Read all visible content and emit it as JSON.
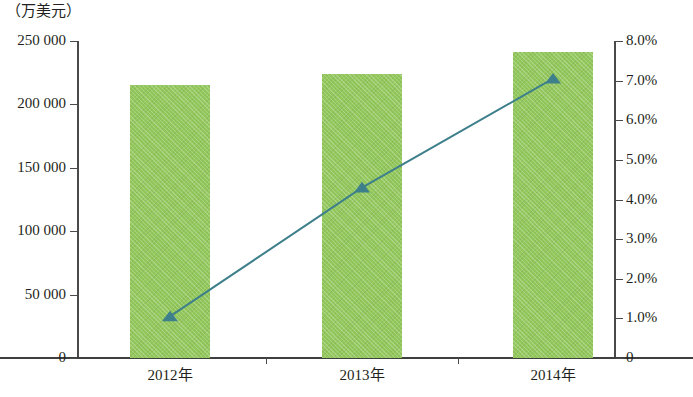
{
  "chart_data": {
    "type": "bar",
    "title": "",
    "subtitle": "",
    "unit_label": "（万美元）",
    "xlabel": "",
    "ylabel": "",
    "categories": [
      "2012年",
      "2013年",
      "2014年"
    ],
    "grid": false,
    "legend_position": "none",
    "series": [
      {
        "name": "金额",
        "type": "bar",
        "axis": "left",
        "color": "#92c85c",
        "values": [
          215000,
          224000,
          241000
        ]
      },
      {
        "name": "增长率",
        "type": "line",
        "axis": "right",
        "color": "#3d7f8a",
        "marker": "triangle",
        "values": [
          1.05,
          4.3,
          7.05
        ]
      }
    ],
    "left_axis": {
      "ylim": [
        0,
        250000
      ],
      "ticks": [
        0,
        50000,
        100000,
        150000,
        200000,
        250000
      ],
      "tick_labels": [
        "0",
        "50 000",
        "100 000",
        "150 000",
        "200 000",
        "250 000"
      ]
    },
    "right_axis": {
      "ylim": [
        0,
        8
      ],
      "ticks": [
        0,
        1,
        2,
        3,
        4,
        5,
        6,
        7,
        8
      ],
      "tick_labels": [
        "0",
        "1.0%",
        "2.0%",
        "3.0%",
        "4.0%",
        "5.0%",
        "6.0%",
        "7.0%",
        "8.0%"
      ]
    },
    "colors": {
      "bar": "#92c85c",
      "line": "#3d7f8a",
      "axis": "#4a4a4a",
      "text": "#231f20",
      "background": "#ffffff"
    }
  }
}
